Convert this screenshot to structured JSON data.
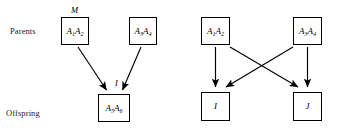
{
  "figure": {
    "row_labels": {
      "parents": "Parents",
      "offspring": "Offspring"
    },
    "colors": {
      "box_border": "#000000",
      "arrow": "#000000",
      "text": "#000000",
      "background": "#ffffff"
    }
  },
  "left_diagram": {
    "parent_mother": {
      "tag": "M",
      "allele_1": "A",
      "sub_1": "1",
      "allele_2": "A",
      "sub_2": "2"
    },
    "parent_father": {
      "allele_1": "A",
      "sub_1": "3",
      "allele_2": "A",
      "sub_2": "4"
    },
    "offspring": {
      "tag": "I",
      "allele_1": "A",
      "sub_1": "5",
      "allele_2": "A",
      "sub_2": "6"
    },
    "arrows": [
      {
        "name": "mother-to-offspring",
        "from": "parent_mother",
        "to": "offspring"
      },
      {
        "name": "father-to-offspring",
        "from": "parent_father",
        "to": "offspring"
      }
    ]
  },
  "right_diagram": {
    "parent_1": {
      "allele_1": "A",
      "sub_1": "1",
      "allele_2": "A",
      "sub_2": "2"
    },
    "parent_2": {
      "allele_1": "A",
      "sub_1": "3",
      "allele_2": "A",
      "sub_2": "4"
    },
    "child_1": {
      "label": "I"
    },
    "child_2": {
      "label": "J"
    },
    "arrows": [
      {
        "name": "parent1-to-child1",
        "from": "parent_1",
        "to": "child_1",
        "style": "vertical"
      },
      {
        "name": "parent1-to-child2",
        "from": "parent_1",
        "to": "child_2",
        "style": "diagonal"
      },
      {
        "name": "parent2-to-child1",
        "from": "parent_2",
        "to": "child_1",
        "style": "diagonal"
      },
      {
        "name": "parent2-to-child2",
        "from": "parent_2",
        "to": "child_2",
        "style": "vertical"
      }
    ]
  }
}
